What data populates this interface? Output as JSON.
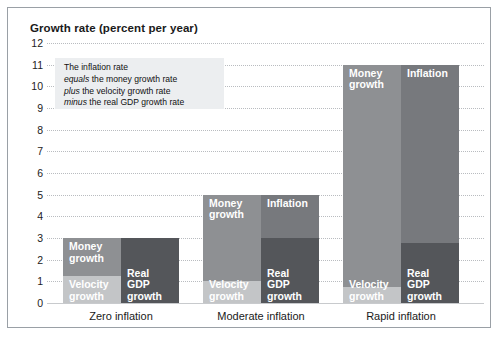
{
  "chart_data": {
    "type": "bar",
    "title": "Growth rate (percent per year)",
    "xlabel": "",
    "ylabel": "Growth rate (percent per year)",
    "ylim": [
      0,
      12
    ],
    "ytick_labels": [
      "12",
      "11",
      "10",
      "9",
      "8",
      "7",
      "6",
      "5",
      "4",
      "3",
      "2",
      "1",
      "0"
    ],
    "ytick_values": [
      12,
      11,
      10,
      9,
      8,
      7,
      6,
      5,
      4,
      3,
      2,
      1,
      0
    ],
    "grid": true,
    "legend": false,
    "stacked": true,
    "categories": [
      "Zero inflation",
      "Moderate inflation",
      "Rapid inflation"
    ],
    "series": [
      {
        "name": "Velocity growth",
        "values": [
          1.25,
          1,
          0.75
        ],
        "bar": "left",
        "color": "#c3c5c7"
      },
      {
        "name": "Money growth",
        "values": [
          1.75,
          4,
          10.25
        ],
        "bar": "left",
        "color": "#8e9093"
      },
      {
        "name": "Real GDP growth",
        "values": [
          3,
          3,
          2.75
        ],
        "bar": "right",
        "color": "#54565a"
      },
      {
        "name": "Inflation",
        "values": [
          0,
          2,
          8.25
        ],
        "bar": "right",
        "color": "#77797d"
      }
    ],
    "bar_totals": {
      "left_bar_totals": [
        3,
        5,
        11
      ],
      "right_bar_totals": [
        3,
        5,
        11
      ]
    },
    "annotation": {
      "line1": "The inflation rate",
      "line2_em": "equals",
      "line2": " the money growth rate",
      "line3_em": "plus",
      "line3": " the velocity growth rate",
      "line4_em": "minus",
      "line4": " the real GDP growth rate"
    }
  },
  "colors": {
    "velocity": "#c3c5c7",
    "money": "#8e9093",
    "inflation": "#77797d",
    "real_gdp": "#54565a",
    "gridline": "#b9bcc0",
    "frame": "#9aa0a6",
    "annotation_bg": "#eceef0",
    "text": "#1a1a1a"
  },
  "groups": [
    {
      "label": "Zero inflation",
      "left_bar": {
        "segments": [
          {
            "name": "Money growth",
            "label_lines": [
              "Money",
              "growth"
            ],
            "from": 1.25,
            "to": 3
          },
          {
            "name": "Velocity growth",
            "label_lines": [
              "Velocity",
              "growth"
            ],
            "from": 0,
            "to": 1.25
          }
        ]
      },
      "right_bar": {
        "segments": [
          {
            "name": "Real GDP growth",
            "label_lines": [
              "Real GDP",
              "growth"
            ],
            "from": 0,
            "to": 3
          }
        ]
      }
    },
    {
      "label": "Moderate inflation",
      "left_bar": {
        "segments": [
          {
            "name": "Money growth",
            "label_lines": [
              "Money",
              "growth"
            ],
            "from": 1,
            "to": 5
          },
          {
            "name": "Velocity growth",
            "label_lines": [
              "Velocity",
              "growth"
            ],
            "from": 0,
            "to": 1
          }
        ]
      },
      "right_bar": {
        "segments": [
          {
            "name": "Inflation",
            "label_lines": [
              "Inflation"
            ],
            "from": 3,
            "to": 5
          },
          {
            "name": "Real GDP growth",
            "label_lines": [
              "Real GDP",
              "growth"
            ],
            "from": 0,
            "to": 3
          }
        ]
      }
    },
    {
      "label": "Rapid inflation",
      "left_bar": {
        "segments": [
          {
            "name": "Money growth",
            "label_lines": [
              "Money",
              "growth"
            ],
            "from": 0.75,
            "to": 11
          },
          {
            "name": "Velocity growth",
            "label_lines": [
              "Velocity",
              "growth"
            ],
            "from": 0,
            "to": 0.75
          }
        ]
      },
      "right_bar": {
        "segments": [
          {
            "name": "Inflation",
            "label_lines": [
              "Inflation"
            ],
            "from": 2.75,
            "to": 11
          },
          {
            "name": "Real GDP growth",
            "label_lines": [
              "Real GDP",
              "growth"
            ],
            "from": 0,
            "to": 2.75
          }
        ]
      }
    }
  ]
}
